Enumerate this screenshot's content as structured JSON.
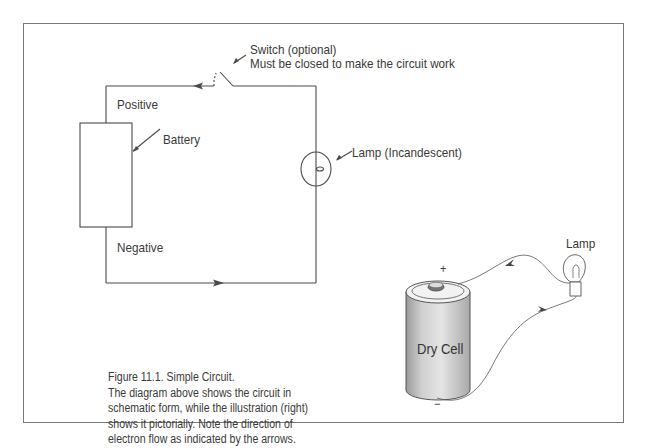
{
  "figure": {
    "schematic": {
      "switch_label_line1": "Switch (optional)",
      "switch_label_line2": "Must be closed to make the circuit work",
      "positive_label": "Positive",
      "negative_label": "Negative",
      "battery_label": "Battery",
      "lamp_label": "Lamp (Incandescent)"
    },
    "pictorial": {
      "lamp_label": "Lamp",
      "cell_label": "Dry Cell",
      "plus_sign": "+",
      "minus_sign": "−"
    },
    "caption": {
      "title": "Figure 11.1. Simple Circuit.",
      "lines": [
        "The diagram above shows the circuit in",
        "schematic form, while the illustration (right)",
        "shows it pictorially. Note the direction of",
        "electron flow as indicated by the arrows."
      ]
    },
    "colors": {
      "line": "#4a4a4a",
      "frame": "#7a7a7a",
      "cell_body": "#c8c8c8"
    }
  }
}
